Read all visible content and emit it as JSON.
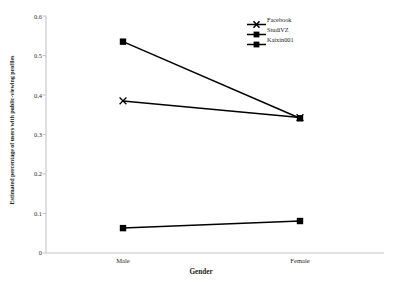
{
  "chart_data": {
    "type": "line",
    "title": "",
    "subtitle": "",
    "xlabel": "Gender",
    "ylabel": "Estimated percentage of users with public-viewing profiles",
    "categories": [
      "Male",
      "Female"
    ],
    "series": [
      {
        "name": "Facebook",
        "values": [
          0.385,
          0.343
        ],
        "marker": "x"
      },
      {
        "name": "StudiVZ",
        "values": [
          0.535,
          0.341
        ],
        "marker": "square"
      },
      {
        "name": "Kaixin001",
        "values": [
          0.063,
          0.081
        ],
        "marker": "square"
      }
    ],
    "ylim": [
      0,
      0.6
    ],
    "ytick_labels": [
      "0",
      "0.1",
      "0.2",
      "0.3",
      "0.4",
      "0.5",
      "0.6"
    ],
    "ytick_values": [
      0,
      0.1,
      0.2,
      0.3,
      0.4,
      0.5,
      0.6
    ],
    "grid": false,
    "legend_position": "top-right",
    "line_color": "#000000",
    "axis_color": "#c8c8c8"
  },
  "axis": {
    "y_title": "Estimated percentage of users with public-viewing profiles",
    "x_title": "Gender",
    "ticks_y": [
      "0.6",
      "0.5",
      "0.4",
      "0.3",
      "0.2",
      "0.1",
      "0"
    ],
    "ticks_x": [
      "Male",
      "Female"
    ]
  },
  "legend": {
    "items": [
      {
        "label": "Facebook"
      },
      {
        "label": "StudiVZ"
      },
      {
        "label": "Kaixin001"
      }
    ]
  }
}
